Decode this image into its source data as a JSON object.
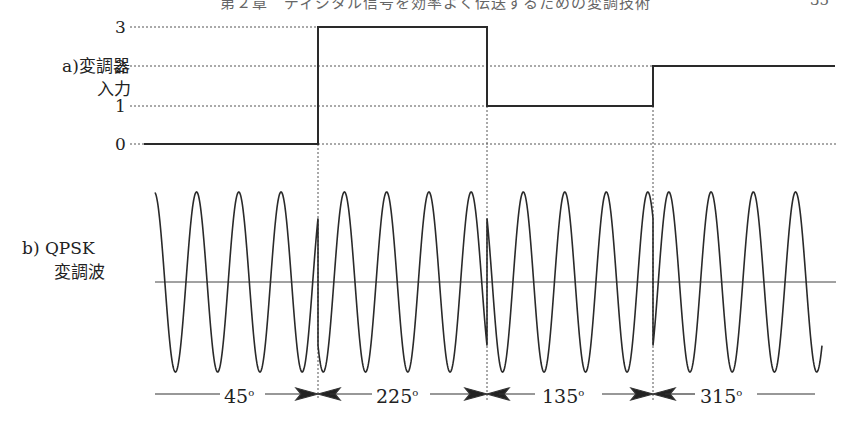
{
  "header": {
    "running_title": "第２章　ディジタル信号を効率よく伝送するための変調技術",
    "page_number": "35"
  },
  "panel_a": {
    "label_line1": "a)変調器",
    "label_line2": "入力",
    "y_ticks": [
      "3",
      "2",
      "1",
      "0"
    ]
  },
  "panel_b": {
    "label_line1": "b) QPSK",
    "label_line2": "変調波"
  },
  "phase_labels": [
    {
      "value": "45",
      "unit": "o"
    },
    {
      "value": "225",
      "unit": "o"
    },
    {
      "value": "135",
      "unit": "o"
    },
    {
      "value": "315",
      "unit": "o"
    }
  ],
  "colors": {
    "line": "#2a2a2a",
    "dashed": "#555555",
    "background": "#ffffff"
  },
  "chart_data": {
    "type": "line",
    "panels": [
      {
        "name": "a) 変調器入力",
        "kind": "step",
        "ylabel": "変調器入力",
        "y_ticks": [
          0,
          1,
          2,
          3
        ],
        "ylim": [
          0,
          3
        ],
        "segments": [
          {
            "x_start": 144,
            "x_end": 318,
            "level": 0
          },
          {
            "x_start": 318,
            "x_end": 487,
            "level": 3
          },
          {
            "x_start": 487,
            "x_end": 653,
            "level": 1
          },
          {
            "x_start": 653,
            "x_end": 835,
            "level": 2
          }
        ]
      },
      {
        "name": "b) QPSK 変調波",
        "kind": "sinusoid",
        "ylabel": "QPSK 変調波",
        "cycles_per_symbol": 4,
        "symbols": [
          {
            "input": 0,
            "phase_deg": 45,
            "x_start": 155,
            "x_end": 318
          },
          {
            "input": 3,
            "phase_deg": 225,
            "x_start": 318,
            "x_end": 487
          },
          {
            "input": 1,
            "phase_deg": 135,
            "x_start": 487,
            "x_end": 653
          },
          {
            "input": 2,
            "phase_deg": 315,
            "x_start": 653,
            "x_end": 822
          }
        ]
      }
    ],
    "annotations": [
      "45°",
      "225°",
      "135°",
      "315°"
    ]
  }
}
